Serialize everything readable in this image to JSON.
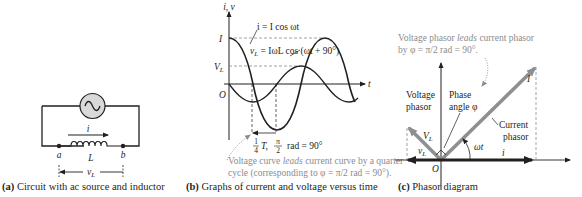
{
  "panel_a": {
    "caption_tag": "(a)",
    "caption_text": "Circuit with ac source and inductor",
    "labels": {
      "current": "i",
      "node_a": "a",
      "node_b": "b",
      "inductor": "L",
      "voltage": "v",
      "voltage_sub": "L"
    }
  },
  "panel_b": {
    "caption_tag": "(b)",
    "caption_text": "Graphs of current and voltage versus time",
    "axis_y": "i, v",
    "axis_x": "t",
    "tick_I": "I",
    "tick_VL": "V",
    "tick_VL_sub": "L",
    "origin": "O",
    "eq_current": "i = I cos ωt",
    "eq_voltage_lhs": "v",
    "eq_voltage_sub": "L",
    "eq_voltage_rhs": " = IωL cos (ωt + 90°)",
    "quarter_label_frac": "1",
    "quarter_label_den": "4",
    "quarter_label_T": "T,",
    "quarter_label_pi": "π",
    "quarter_label_2": "2",
    "quarter_label_rad": "rad = 90°",
    "note_line1_pre": "Voltage curve ",
    "note_line1_em": "leads",
    "note_line1_post": " current curve by a quarter",
    "note_line2": "cycle (corresponding to φ = π/2 rad = 90°)."
  },
  "panel_c": {
    "caption_tag": "(c)",
    "caption_text": "Phasor diagram",
    "note_line1_pre": "Voltage phasor ",
    "note_line1_em": "leads",
    "note_line1_post": " current phasor",
    "note_line2": "by φ = π/2 rad = 90°.",
    "label_voltage_phasor_1": "Voltage",
    "label_voltage_phasor_2": "phasor",
    "label_phase_1": "Phase",
    "label_phase_2": "angle φ",
    "label_current_phasor_1": "Current",
    "label_current_phasor_2": "phasor",
    "label_I": "I",
    "label_VL": "V",
    "label_VL_sub": "L",
    "label_vL": "v",
    "label_vL_sub": "L",
    "label_omega_t": "ωt",
    "label_i": "i",
    "origin": "O"
  },
  "colors": {
    "ink": "#231f20",
    "gray_text": "#8a8c8e",
    "phasor_gray": "#8e8f91",
    "source_fill": "#d9d9d9"
  }
}
